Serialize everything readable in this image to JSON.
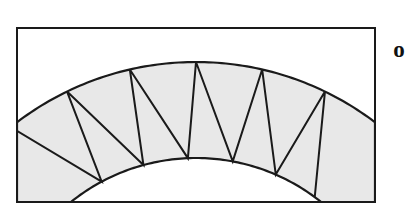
{
  "figure": {
    "background_color": "#ffffff",
    "label": {
      "text": "o",
      "name": "center-point-label",
      "x": 399,
      "y": 50
    },
    "frame": {
      "name": "figure-border-rectangle",
      "x": 16,
      "y": 27,
      "width": 360,
      "height": 176,
      "stroke_color": "#1a1a1a",
      "stroke_width": 2,
      "fill_color": "#ffffff"
    },
    "band": {
      "name": "annulus-sector-band",
      "fill_color": "#e8e8e8",
      "stroke_color": "#1a1a1a",
      "stroke_width": 2.2,
      "center_x": 196,
      "center_y": 358,
      "outer_radius": 296,
      "inner_radius": 200,
      "outer_apex_y": 62,
      "inner_apex_y": 158,
      "outer_left_edge_y": 113,
      "outer_right_edge_y": 113,
      "inner_bottom_left_x": 85,
      "inner_bottom_right_x": 307
    },
    "zigzag": {
      "name": "inscribed-triangle-zigzag",
      "stroke_color": "#1a1a1a",
      "stroke_width": 2,
      "teeth_count": 6,
      "outer_vertices_count": 6,
      "inner_vertices_count": 6,
      "description": "Sawtooth polyline alternating between vertices on the outer arc and vertices on the inner arc"
    }
  },
  "chart_data": {
    "type": "diagram",
    "outer_arc_points": [
      [
        16,
        113
      ],
      [
        48,
        92
      ],
      [
        88,
        74
      ],
      [
        140,
        64
      ],
      [
        196,
        62
      ],
      [
        252,
        64
      ],
      [
        304,
        74
      ],
      [
        344,
        92
      ],
      [
        376,
        113
      ]
    ],
    "inner_arc_points": [
      [
        85,
        203
      ],
      [
        112,
        180
      ],
      [
        150,
        165
      ],
      [
        196,
        158
      ],
      [
        242,
        165
      ],
      [
        280,
        180
      ],
      [
        307,
        203
      ]
    ],
    "zigzag_outer_vertices": [
      [
        45,
        113
      ],
      [
        104,
        80
      ],
      [
        160,
        66
      ],
      [
        224,
        66
      ],
      [
        288,
        79
      ],
      [
        336,
        100
      ]
    ],
    "zigzag_inner_vertices": [
      [
        83,
        203
      ],
      [
        129,
        172
      ],
      [
        176,
        160
      ],
      [
        222,
        160
      ],
      [
        268,
        171
      ],
      [
        318,
        196
      ]
    ]
  }
}
